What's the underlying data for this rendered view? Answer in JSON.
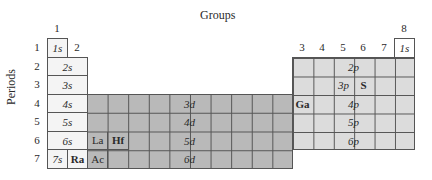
{
  "title": "Groups",
  "ylabel": "Periods",
  "group_labels": [
    {
      "label": "1",
      "col": 0,
      "row": -1
    },
    {
      "label": "2",
      "col": 1,
      "row": 0
    },
    {
      "label": "3",
      "col": 12,
      "row": 0
    },
    {
      "label": "4",
      "col": 13,
      "row": 0
    },
    {
      "label": "5",
      "col": 14,
      "row": 0
    },
    {
      "label": "6",
      "col": 15,
      "row": 0
    },
    {
      "label": "7",
      "col": 16,
      "row": 0
    },
    {
      "label": "8",
      "col": 17,
      "row": -1
    }
  ],
  "period_labels": [
    "1",
    "2",
    "3",
    "4",
    "5",
    "6",
    "7"
  ],
  "orbitals": {
    "s": [
      "1s",
      "2s",
      "3s",
      "4s",
      "5s",
      "6s",
      "7s"
    ],
    "d": [
      "3d",
      "4d",
      "5d",
      "6d"
    ],
    "p": [
      "2p",
      "3p",
      "4p",
      "5p",
      "6p"
    ],
    "he": "1s"
  },
  "elements": {
    "S": "S",
    "Ga": "Ga",
    "La": "La",
    "Hf": "Hf",
    "Ra": "Ra",
    "Ac": "Ac"
  },
  "colors": {
    "s_block": "#f4f4f4",
    "d_block": "#b9b9b9",
    "p_block": "#dcdcdc",
    "border": "#555555"
  }
}
